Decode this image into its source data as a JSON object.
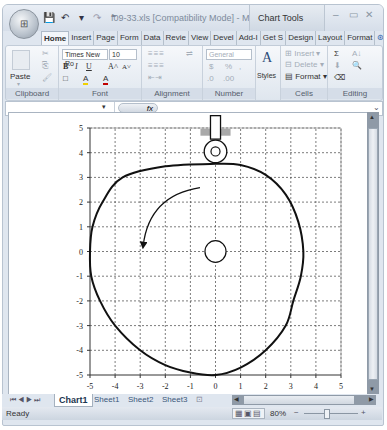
{
  "window": {
    "title": "f09-33.xls [Compatibility Mode] - Mi...",
    "contextual_tab_group": "Chart Tools",
    "controls": {
      "minimize": "–",
      "maximize": "▭",
      "close": "✕"
    },
    "office_button_icon": "office-logo"
  },
  "qat": {
    "save_icon": "💾",
    "undo_icon": "↶",
    "undo_arrow": "▾",
    "redo_icon": "↷",
    "customize": "⁼"
  },
  "tabs": [
    {
      "label": "Home",
      "active": true
    },
    {
      "label": "Insert"
    },
    {
      "label": "Page"
    },
    {
      "label": "Form"
    },
    {
      "label": "Data"
    },
    {
      "label": "Revie"
    },
    {
      "label": "View"
    },
    {
      "label": "Devel"
    },
    {
      "label": "Add-I"
    },
    {
      "label": "Get S"
    },
    {
      "label": "Design"
    },
    {
      "label": "Layout"
    },
    {
      "label": "Format"
    }
  ],
  "ribbon": {
    "clipboard": {
      "label": "Clipboard",
      "paste": "Paste",
      "paste_arrow": "▾",
      "cut_icon": "✂",
      "copy_icon": "⎘",
      "format_painter_icon": "🖌"
    },
    "font": {
      "label": "Font",
      "font_name": "Times New Ro",
      "font_size": "10",
      "bold": "B",
      "italic": "I",
      "underline": "U",
      "grow": "A˄",
      "shrink": "A˅",
      "border_icon": "□",
      "fill_icon": "A",
      "font_color": "A"
    },
    "alignment": {
      "label": "Alignment",
      "wrap_icon": "⇌",
      "indent_icon": "⇤",
      "outdent_icon": "⇥"
    },
    "number": {
      "label": "Number",
      "format": "General",
      "currency": "$",
      "percent": "%",
      "comma": ",",
      "inc_decimal": ".0",
      "dec_decimal": ".00"
    },
    "styles": {
      "label": "Styles",
      "icon": "A"
    },
    "cells": {
      "label": "Cells",
      "insert": "Insert",
      "delete": "Delete",
      "format": "Format"
    },
    "editing": {
      "label": "Editing",
      "sum": "Σ",
      "sort": "A↓",
      "fill": "⬇",
      "find": "🔍",
      "clear": "⌫"
    }
  },
  "formula_bar": {
    "name_box": "",
    "fx": "fx",
    "value": ""
  },
  "sheet_tabs": [
    {
      "label": "Chart1",
      "active": true
    },
    {
      "label": "Sheet1"
    },
    {
      "label": "Sheet2"
    },
    {
      "label": "Sheet3"
    }
  ],
  "status": {
    "text": "Ready",
    "zoom": "80%",
    "zoom_out": "−",
    "zoom_in": "+"
  },
  "chart_data": {
    "type": "scatter",
    "title": "",
    "xlabel": "",
    "ylabel": "",
    "xlim": [
      -5,
      5
    ],
    "ylim": [
      -5,
      5
    ],
    "x_ticks": [
      "-5",
      "-4",
      "-3",
      "-2",
      "-1",
      "0",
      "1",
      "2",
      "3",
      "4",
      "5"
    ],
    "y_ticks": [
      "5",
      "4",
      "3",
      "2",
      "1",
      "0",
      "-1",
      "-2",
      "-3",
      "-4",
      "-5"
    ],
    "grid": "dashed, major x and y",
    "legend": "none",
    "series": [
      {
        "name": "cam profile",
        "style": "smooth line",
        "points": [
          [
            0,
            3.55
          ],
          [
            1,
            3.5
          ],
          [
            2,
            3.1
          ],
          [
            2.8,
            2.3
          ],
          [
            3.3,
            1.2
          ],
          [
            3.5,
            0
          ],
          [
            3.4,
            -1
          ],
          [
            3.1,
            -2
          ],
          [
            2.8,
            -3
          ],
          [
            2,
            -4
          ],
          [
            1,
            -4.7
          ],
          [
            0,
            -5
          ],
          [
            -1,
            -4.9
          ],
          [
            -2,
            -4.6
          ],
          [
            -3,
            -4
          ],
          [
            -4,
            -3
          ],
          [
            -4.6,
            -2
          ],
          [
            -4.95,
            -1
          ],
          [
            -5,
            0
          ],
          [
            -4.9,
            1
          ],
          [
            -4.5,
            2
          ],
          [
            -3.7,
            3
          ],
          [
            -2,
            3.45
          ],
          [
            0,
            3.55
          ]
        ]
      }
    ],
    "annotations": [
      {
        "type": "circle",
        "label": "shaft",
        "center": [
          0,
          0
        ],
        "radius": 0.42
      },
      {
        "type": "roller follower",
        "center": [
          0,
          4.05
        ],
        "radius": 0.5,
        "inner_radius": 0.18
      },
      {
        "type": "follower stem",
        "x_range": [
          -0.2,
          0.2
        ],
        "y_range": [
          4.55,
          5.5
        ]
      },
      {
        "type": "guide bearing",
        "y": 4.85,
        "x_range": [
          -0.6,
          0.6
        ]
      },
      {
        "type": "arrow",
        "label": "rotation direction (counter-clockwise)",
        "from": [
          -0.5,
          2.75
        ],
        "to": [
          -2.8,
          0
        ]
      }
    ]
  }
}
